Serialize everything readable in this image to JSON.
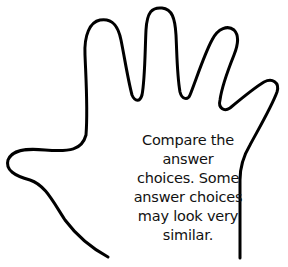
{
  "illustration": {
    "subject": "hand-outline",
    "stroke_color": "#000000",
    "background": "#ffffff"
  },
  "caption": {
    "lines": [
      "Compare the",
      "answer",
      "choices. Some",
      "answer choices",
      "may look very",
      "similar."
    ]
  }
}
